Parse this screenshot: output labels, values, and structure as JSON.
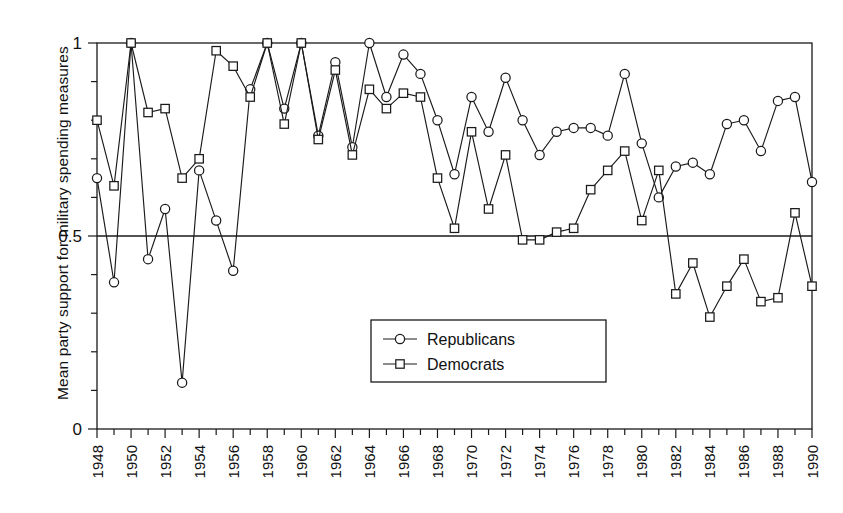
{
  "chart_data": {
    "type": "line",
    "title": "",
    "xlabel": "",
    "ylabel": "Mean party support for military spending measures",
    "xlim": [
      1948,
      1990
    ],
    "ylim": [
      0,
      1
    ],
    "yticks": [
      0,
      0.5,
      1
    ],
    "ytick_labels": [
      "0",
      "0.5",
      "1"
    ],
    "y_minor_tick_step": 0.1,
    "x_minor_tick_step": 1,
    "grid": false,
    "gridlines_drawn_at_y": [
      0.5,
      1.0
    ],
    "legend_position": "center",
    "x": [
      1948,
      1949,
      1950,
      1951,
      1952,
      1953,
      1954,
      1955,
      1956,
      1957,
      1958,
      1959,
      1960,
      1961,
      1962,
      1963,
      1964,
      1965,
      1966,
      1967,
      1968,
      1969,
      1970,
      1971,
      1972,
      1973,
      1974,
      1975,
      1976,
      1977,
      1978,
      1979,
      1980,
      1981,
      1982,
      1983,
      1984,
      1985,
      1986,
      1987,
      1988,
      1989,
      1990
    ],
    "xtick_labels": [
      "1948",
      "1950",
      "1952",
      "1954",
      "1956",
      "1958",
      "1960",
      "1962",
      "1964",
      "1966",
      "1968",
      "1970",
      "1972",
      "1974",
      "1976",
      "1978",
      "1980",
      "1982",
      "1984",
      "1986",
      "1988",
      "1990"
    ],
    "series": [
      {
        "name": "Republicans",
        "marker": "circle",
        "values": [
          0.65,
          0.38,
          1.0,
          0.44,
          0.57,
          0.12,
          0.67,
          0.54,
          0.41,
          0.88,
          1.0,
          0.83,
          1.0,
          0.76,
          0.95,
          0.73,
          1.0,
          0.86,
          0.97,
          0.92,
          0.8,
          0.66,
          0.86,
          0.77,
          0.91,
          0.8,
          0.71,
          0.77,
          0.78,
          0.78,
          0.76,
          0.92,
          0.74,
          0.6,
          0.68,
          0.69,
          0.66,
          0.79,
          0.8,
          0.72,
          0.85,
          0.86,
          0.64
        ]
      },
      {
        "name": "Democrats",
        "marker": "square",
        "values": [
          0.8,
          0.63,
          1.0,
          0.82,
          0.83,
          0.65,
          0.7,
          0.98,
          0.94,
          0.86,
          1.0,
          0.79,
          1.0,
          0.75,
          0.93,
          0.71,
          0.88,
          0.83,
          0.87,
          0.86,
          0.65,
          0.52,
          0.77,
          0.57,
          0.71,
          0.49,
          0.49,
          0.51,
          0.52,
          0.62,
          0.67,
          0.72,
          0.54,
          0.67,
          0.35,
          0.43,
          0.29,
          0.37,
          0.44,
          0.33,
          0.34,
          0.56,
          0.37
        ]
      }
    ]
  },
  "legend": {
    "items": [
      {
        "label": "Republicans",
        "marker": "circle"
      },
      {
        "label": "Democrats",
        "marker": "square"
      }
    ]
  },
  "axis": {
    "y_label": "Mean party support for military spending measures"
  }
}
